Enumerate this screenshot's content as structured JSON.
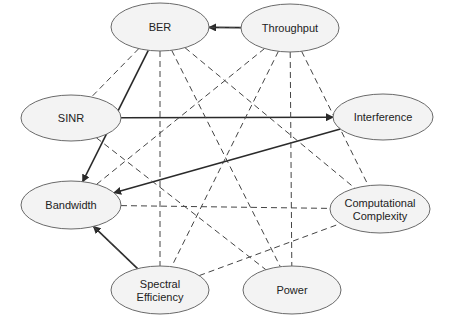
{
  "diagram": {
    "type": "graph",
    "nodes": [
      {
        "id": "ber",
        "label": "BER",
        "lines": [
          "BER"
        ],
        "cx": 160,
        "cy": 27,
        "rx": 49,
        "ry": 24
      },
      {
        "id": "throughput",
        "label": "Throughput",
        "lines": [
          "Throughput"
        ],
        "cx": 290,
        "cy": 28,
        "rx": 49,
        "ry": 24
      },
      {
        "id": "sinr",
        "label": "SINR",
        "lines": [
          "SINR"
        ],
        "cx": 71,
        "cy": 118,
        "rx": 50,
        "ry": 23
      },
      {
        "id": "interference",
        "label": "Interference",
        "lines": [
          "Interference"
        ],
        "cx": 383,
        "cy": 117,
        "rx": 50,
        "ry": 23
      },
      {
        "id": "bandwidth",
        "label": "Bandwidth",
        "lines": [
          "Bandwidth"
        ],
        "cx": 71,
        "cy": 205,
        "rx": 50,
        "ry": 24
      },
      {
        "id": "computational",
        "label": "Computational Complexity",
        "lines": [
          "Computational",
          "Complexity"
        ],
        "cx": 380,
        "cy": 209,
        "rx": 50,
        "ry": 24
      },
      {
        "id": "spectral",
        "label": "Spectral Efficiency",
        "lines": [
          "Spectral",
          "Efficiency"
        ],
        "cx": 160,
        "cy": 290,
        "rx": 49,
        "ry": 24
      },
      {
        "id": "power",
        "label": "Power",
        "lines": [
          "Power"
        ],
        "cx": 292,
        "cy": 290,
        "rx": 49,
        "ry": 24
      }
    ],
    "edges": [
      {
        "from": "throughput",
        "to": "ber",
        "style": "solid",
        "arrow": true
      },
      {
        "from": "sinr",
        "to": "interference",
        "style": "solid",
        "arrow": true
      },
      {
        "from": "interference",
        "to": "bandwidth",
        "style": "solid",
        "arrow": true
      },
      {
        "from": "ber",
        "to": "bandwidth",
        "style": "solid",
        "arrow": true
      },
      {
        "from": "spectral",
        "to": "bandwidth",
        "style": "solid",
        "arrow": true
      },
      {
        "from": "ber",
        "to": "throughput",
        "style": "dashed",
        "arrow": false
      },
      {
        "from": "ber",
        "to": "sinr",
        "style": "dashed",
        "arrow": false
      },
      {
        "from": "ber",
        "to": "spectral",
        "style": "dashed",
        "arrow": false
      },
      {
        "from": "ber",
        "to": "power",
        "style": "dashed",
        "arrow": false
      },
      {
        "from": "ber",
        "to": "computational",
        "style": "dashed",
        "arrow": false
      },
      {
        "from": "throughput",
        "to": "bandwidth",
        "style": "dashed",
        "arrow": false
      },
      {
        "from": "throughput",
        "to": "spectral",
        "style": "dashed",
        "arrow": false
      },
      {
        "from": "throughput",
        "to": "power",
        "style": "dashed",
        "arrow": false
      },
      {
        "from": "throughput",
        "to": "computational",
        "style": "dashed",
        "arrow": false
      },
      {
        "from": "sinr",
        "to": "power",
        "style": "dashed",
        "arrow": false
      },
      {
        "from": "bandwidth",
        "to": "computational",
        "style": "dashed",
        "arrow": false
      },
      {
        "from": "bandwidth",
        "to": "spectral",
        "style": "dashed",
        "arrow": false
      },
      {
        "from": "spectral",
        "to": "computational",
        "style": "dashed",
        "arrow": false
      }
    ]
  }
}
